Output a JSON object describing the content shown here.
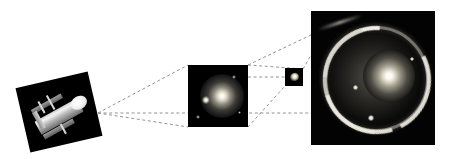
{
  "figure": {
    "background_color": "#ffffff",
    "width": 451,
    "height": 159,
    "connector_color": "#808080",
    "connector_style": "dashed"
  },
  "panels": [
    {
      "id": "telescope",
      "name": "hubble-space-telescope-photo",
      "caption": "",
      "rotation_deg": -13,
      "background_color": "#000000",
      "x": 22,
      "y": 79,
      "width": 74,
      "height": 66,
      "content": "Hubble Space Telescope spacecraft with solar arrays and open aperture door"
    },
    {
      "id": "wide-field",
      "name": "wide-field-galaxy-image",
      "caption": "",
      "background_color": "#000000",
      "x": 188,
      "y": 65,
      "width": 60,
      "height": 62,
      "content": "Bright elliptical galaxy with a fainter companion source to the lower left"
    },
    {
      "id": "inset-crop",
      "name": "small-crop-inset",
      "caption": "",
      "background_color": "#000000",
      "x": 285,
      "y": 68,
      "width": 18,
      "height": 18,
      "content": "Small unresolved crop of the lensing galaxy region"
    },
    {
      "id": "einstein-ring",
      "name": "einstein-ring-closeup",
      "caption": "",
      "background_color": "#000000",
      "x": 311,
      "y": 11,
      "width": 124,
      "height": 134,
      "content": "Close-up revealing a near-complete Einstein ring of lensed arcs around a bright central lens galaxy"
    }
  ],
  "connectors": [
    {
      "name": "telescope-to-wide-top",
      "from": [
        98,
        113
      ],
      "to": [
        188,
        65
      ]
    },
    {
      "name": "telescope-to-wide-bottom",
      "from": [
        98,
        113
      ],
      "to": [
        188,
        127
      ]
    },
    {
      "name": "wide-to-inset-top",
      "from": [
        248,
        65
      ],
      "to": [
        303,
        68
      ]
    },
    {
      "name": "wide-to-inset-mid",
      "from": [
        248,
        76
      ],
      "to": [
        285,
        76
      ]
    },
    {
      "name": "wide-to-inset-bottom",
      "from": [
        248,
        127
      ],
      "to": [
        285,
        86
      ]
    },
    {
      "name": "inset-to-ring-top",
      "from": [
        303,
        68
      ],
      "to": [
        311,
        40
      ]
    },
    {
      "name": "baseline-to-ring",
      "from": [
        98,
        113
      ],
      "to": [
        435,
        113
      ]
    }
  ],
  "markers": {
    "wide_field_stars": [
      {
        "x": 10,
        "y": 52,
        "r": 2
      },
      {
        "x": 46,
        "y": 12,
        "r": 2
      },
      {
        "x": 52,
        "y": 48,
        "r": 1.5
      }
    ],
    "ring_stars": [
      {
        "x": 44,
        "y": 76,
        "r": 3
      },
      {
        "x": 60,
        "y": 106,
        "r": 4
      },
      {
        "x": 100,
        "y": 48,
        "r": 2
      }
    ]
  }
}
